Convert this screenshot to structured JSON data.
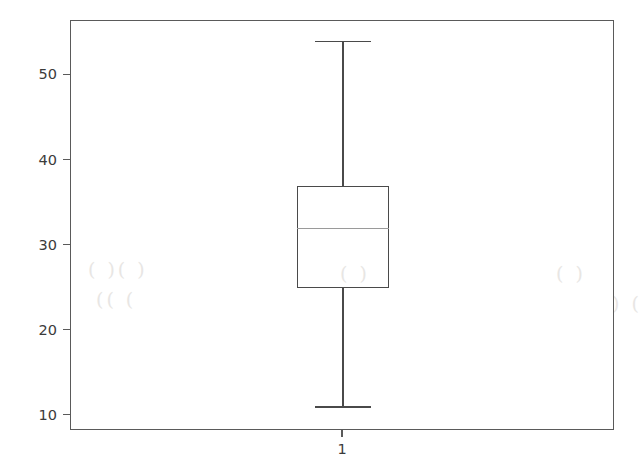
{
  "chart_data": {
    "type": "box",
    "title": "",
    "xlabel": "",
    "ylabel": "",
    "categories": [
      "1"
    ],
    "xtick_labels": [
      "1"
    ],
    "ytick_labels": [
      "10",
      "20",
      "30",
      "40",
      "50"
    ],
    "ytick_values": [
      10,
      20,
      30,
      40,
      50
    ],
    "ylim": [
      8.2,
      56.4
    ],
    "grid": false,
    "legend": null,
    "boxes": [
      {
        "label": "1",
        "whisker_low": 11,
        "q1": 25,
        "median": 32,
        "q3": 37,
        "whisker_high": 54,
        "outliers": []
      }
    ]
  },
  "axes": {
    "y_ticks": [
      {
        "label": "50",
        "value": 50
      },
      {
        "label": "40",
        "value": 40
      },
      {
        "label": "30",
        "value": 30
      },
      {
        "label": "20",
        "value": 20
      },
      {
        "label": "10",
        "value": 10
      }
    ],
    "x_ticks": [
      {
        "label": "1",
        "value": 1
      }
    ]
  },
  "style": {
    "background": "#ffffff",
    "frame_color": "#5a5a5a",
    "box_color": "#4a4a4a",
    "median_color": "#9a9a9a",
    "tick_label_color": "#3b3b3b"
  },
  "artifacts": {
    "smudge_1": "( )( )",
    "smudge_2": "(( (",
    "smudge_3": "( )",
    "smudge_4": "( )",
    "smudge_5": ") ("
  }
}
